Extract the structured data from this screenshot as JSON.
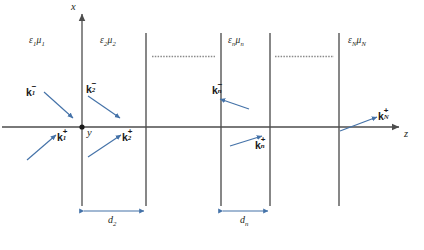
{
  "figure": {
    "background_color": "#ffffff",
    "axis_color": "#4d4d4d",
    "interface_color": "#3f3f3f",
    "arrow_color": "#4472a8",
    "text_color": "#231f20"
  },
  "axes": {
    "vertical_label": "x",
    "horizontal_label": "z",
    "third_label": "y",
    "origin_marker": "origin-dot"
  },
  "media_labels": [
    {
      "id": "medium-1",
      "eps": "ε",
      "eps_sub": "1",
      "mu": "μ",
      "mu_sub": "1"
    },
    {
      "id": "medium-2",
      "eps": "ε",
      "eps_sub": "2",
      "mu": "μ",
      "mu_sub": "2"
    },
    {
      "id": "medium-n",
      "eps": "ε",
      "eps_sub": "n",
      "mu": "μ",
      "mu_sub": "n"
    },
    {
      "id": "medium-N",
      "eps": "ε",
      "eps_sub": "N",
      "mu": "μ",
      "mu_sub": "N"
    }
  ],
  "wavevectors": [
    {
      "id": "k1-minus",
      "base": "k",
      "sub": "1",
      "sup": "−",
      "direction": "down-right"
    },
    {
      "id": "k1-plus",
      "base": "k",
      "sub": "1",
      "sup": "+",
      "direction": "up-right"
    },
    {
      "id": "k2-minus",
      "base": "k",
      "sub": "2",
      "sup": "−",
      "direction": "down-right"
    },
    {
      "id": "k2-plus",
      "base": "k",
      "sub": "2",
      "sup": "+",
      "direction": "up-right"
    },
    {
      "id": "kn-minus",
      "base": "k",
      "sub": "n",
      "sup": "−",
      "direction": "down-right"
    },
    {
      "id": "kn-plus",
      "base": "k",
      "sub": "n",
      "sup": "+",
      "direction": "up-right"
    },
    {
      "id": "kN-plus",
      "base": "k",
      "sub": "N",
      "sup": "+",
      "direction": "up-right"
    }
  ],
  "dimensions": [
    {
      "id": "d2",
      "base": "d",
      "sub": "2"
    },
    {
      "id": "dn",
      "base": "d",
      "sub": "n"
    }
  ],
  "ellipsis": {
    "id": "layer-ellipsis",
    "glyph": "· · · · · · · · · · · · · ·",
    "count": 2
  }
}
